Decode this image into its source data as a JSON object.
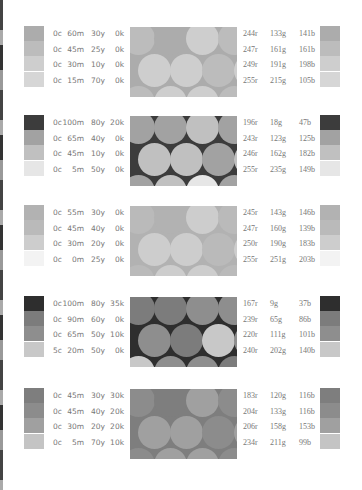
{
  "palettes": [
    {
      "colors": [
        {
          "cmyk": [
            "0c",
            "60m",
            "30y",
            "0k"
          ],
          "rgb": [
            "244r",
            "133g",
            "141b"
          ],
          "hex": "#f4858d",
          "gray": "#acacac"
        },
        {
          "cmyk": [
            "0c",
            "45m",
            "25y",
            "0k"
          ],
          "rgb": [
            "247r",
            "161g",
            "161b"
          ],
          "hex": "#f7a1a1",
          "gray": "#bcbcbc"
        },
        {
          "cmyk": [
            "0c",
            "30m",
            "10y",
            "0k"
          ],
          "rgb": [
            "249r",
            "191g",
            "198b"
          ],
          "hex": "#f9bfc6",
          "gray": "#cecece"
        },
        {
          "cmyk": [
            "0c",
            "15m",
            "70y",
            "0k"
          ],
          "rgb": [
            "255r",
            "215g",
            "105b"
          ],
          "hex": "#ffd769",
          "gray": "#d6d6d6"
        }
      ]
    },
    {
      "colors": [
        {
          "cmyk": [
            "0c",
            "100m",
            "80y",
            "20k"
          ],
          "rgb": [
            "196r",
            "18g",
            "47b"
          ],
          "hex": "#c4122f",
          "gray": "#3c3c3c"
        },
        {
          "cmyk": [
            "0c",
            "65m",
            "40y",
            "0k"
          ],
          "rgb": [
            "243r",
            "123g",
            "125b"
          ],
          "hex": "#f37b7d",
          "gray": "#a2a2a2"
        },
        {
          "cmyk": [
            "0c",
            "45m",
            "10y",
            "0k"
          ],
          "rgb": [
            "246r",
            "162g",
            "182b"
          ],
          "hex": "#f6a2b6",
          "gray": "#c0c0c0"
        },
        {
          "cmyk": [
            "0c",
            "5m",
            "50y",
            "0k"
          ],
          "rgb": [
            "255r",
            "235g",
            "149b"
          ],
          "hex": "#ffeb95",
          "gray": "#e6e6e6"
        }
      ]
    },
    {
      "colors": [
        {
          "cmyk": [
            "0c",
            "55m",
            "30y",
            "0k"
          ],
          "rgb": [
            "245r",
            "143g",
            "146b"
          ],
          "hex": "#f58f92",
          "gray": "#b2b2b2"
        },
        {
          "cmyk": [
            "0c",
            "45m",
            "40y",
            "0k"
          ],
          "rgb": [
            "247r",
            "160g",
            "139b"
          ],
          "hex": "#f7a08b",
          "gray": "#bababa"
        },
        {
          "cmyk": [
            "0c",
            "30m",
            "20y",
            "0k"
          ],
          "rgb": [
            "250r",
            "190g",
            "183b"
          ],
          "hex": "#fabeb7",
          "gray": "#cdcdcd"
        },
        {
          "cmyk": [
            "0c",
            "0m",
            "25y",
            "0k"
          ],
          "rgb": [
            "255r",
            "251g",
            "203b"
          ],
          "hex": "#fffbcb",
          "gray": "#f3f3f3"
        }
      ]
    },
    {
      "colors": [
        {
          "cmyk": [
            "0c",
            "100m",
            "80y",
            "35k"
          ],
          "rgb": [
            "167r",
            "9g",
            "37b"
          ],
          "hex": "#a70925",
          "gray": "#2e2e2e"
        },
        {
          "cmyk": [
            "0c",
            "90m",
            "60y",
            "0k"
          ],
          "rgb": [
            "239r",
            "65g",
            "86b"
          ],
          "hex": "#ef4156",
          "gray": "#7c7c7c"
        },
        {
          "cmyk": [
            "0c",
            "65m",
            "50y",
            "10k"
          ],
          "rgb": [
            "220r",
            "111g",
            "101b"
          ],
          "hex": "#dc6f65",
          "gray": "#8e8e8e"
        },
        {
          "cmyk": [
            "5c",
            "20m",
            "50y",
            "0k"
          ],
          "rgb": [
            "240r",
            "202g",
            "140b"
          ],
          "hex": "#f0ca8c",
          "gray": "#c8c8c8"
        }
      ]
    },
    {
      "colors": [
        {
          "cmyk": [
            "0c",
            "45m",
            "30y",
            "30k"
          ],
          "rgb": [
            "183r",
            "120g",
            "116b"
          ],
          "hex": "#b77874",
          "gray": "#7e7e7e"
        },
        {
          "cmyk": [
            "0c",
            "45m",
            "40y",
            "20k"
          ],
          "rgb": [
            "204r",
            "133g",
            "116b"
          ],
          "hex": "#cc8574",
          "gray": "#8c8c8c"
        },
        {
          "cmyk": [
            "0c",
            "30m",
            "20y",
            "20k"
          ],
          "rgb": [
            "206r",
            "158g",
            "153b"
          ],
          "hex": "#ce9e99",
          "gray": "#a0a0a0"
        },
        {
          "cmyk": [
            "0c",
            "5m",
            "70y",
            "10k"
          ],
          "rgb": [
            "234r",
            "211g",
            "99b"
          ],
          "hex": "#ead363",
          "gray": "#c4c4c4"
        }
      ]
    }
  ]
}
